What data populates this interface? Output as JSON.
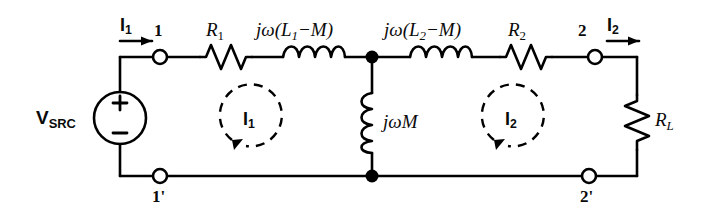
{
  "figure": {
    "type": "electrical-circuit-schematic",
    "background_color": "#ffffff",
    "line_color": "#000000"
  },
  "source": {
    "name": "voltage-source",
    "label_main": "V",
    "label_sub": "SRC",
    "polarity_plus": "+",
    "polarity_minus": "−"
  },
  "components": {
    "r1": {
      "label_main": "R",
      "label_sub": "1",
      "type": "resistor"
    },
    "l1": {
      "label": "jω(L",
      "label_sub": "1",
      "label_tail": "−M)",
      "type": "inductor"
    },
    "l2": {
      "label": "jω(L",
      "label_sub": "2",
      "label_tail": "−M)",
      "type": "inductor"
    },
    "r2": {
      "label_main": "R",
      "label_sub": "2",
      "type": "resistor"
    },
    "m": {
      "label": "jωM",
      "type": "inductor"
    },
    "rl": {
      "label_main": "R",
      "label_sub": "L",
      "type": "resistor"
    }
  },
  "terminals": {
    "top_left": "1",
    "bottom_left": "1'",
    "top_right": "2",
    "bottom_right": "2'"
  },
  "currents": {
    "input_main": "I",
    "input_sub": "1",
    "output_main": "I",
    "output_sub": "2",
    "mesh1_main": "I",
    "mesh1_sub": "1",
    "mesh2_main": "I",
    "mesh2_sub": "2"
  }
}
